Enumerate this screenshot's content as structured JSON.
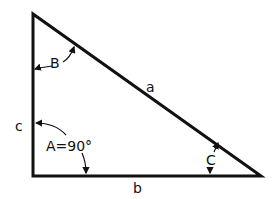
{
  "diagram": {
    "type": "right-triangle",
    "sides": {
      "a": "a",
      "b": "b",
      "c": "c"
    },
    "angles": {
      "A": "A=90°",
      "B": "B",
      "C": "C"
    },
    "colors": {
      "stroke": "#111111",
      "background": "#ffffff"
    }
  }
}
